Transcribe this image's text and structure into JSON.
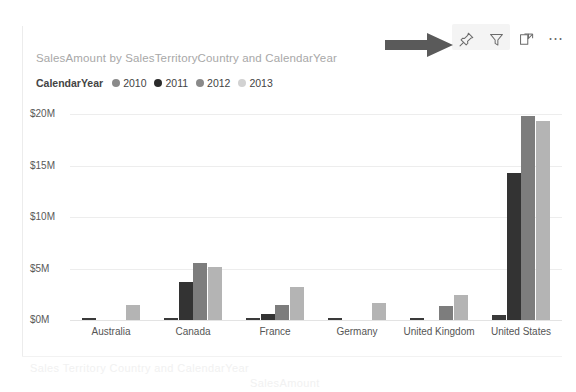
{
  "tile": {
    "title": "SalesAmount by SalesTerritoryCountry and CalendarYear"
  },
  "toolbar": {
    "pin_label": "Pin visual",
    "filter_label": "Filters",
    "focus_label": "Focus mode",
    "more_label": "⋯"
  },
  "annotation": {
    "arrow_name": "right-pointing-arrow",
    "color": "#5a5a5a"
  },
  "legend": {
    "title": "CalendarYear",
    "items": [
      {
        "label": "2010",
        "color": "#8a8a8a"
      },
      {
        "label": "2011",
        "color": "#2b2b2b"
      },
      {
        "label": "2012",
        "color": "#8a8a8a"
      },
      {
        "label": "2013",
        "color": "#d2d2d2"
      }
    ]
  },
  "chart_data": {
    "type": "bar",
    "title": "SalesAmount by SalesTerritoryCountry and CalendarYear",
    "xlabel": "",
    "ylabel": "",
    "categories": [
      "Australia",
      "Canada",
      "France",
      "Germany",
      "United Kingdom",
      "United States"
    ],
    "series": [
      {
        "name": "2010",
        "color": "#3a3a3a",
        "values": [
          0.15,
          0.2,
          0.12,
          0.1,
          0.18,
          0.45
        ]
      },
      {
        "name": "2011",
        "color": "#333333",
        "values": [
          0.0,
          3.7,
          0.55,
          0.0,
          0.0,
          14.3
        ]
      },
      {
        "name": "2012",
        "color": "#7d7d7d",
        "values": [
          0.0,
          5.5,
          1.5,
          0.0,
          1.4,
          19.8
        ]
      },
      {
        "name": "2013",
        "color": "#b4b4b4",
        "values": [
          1.5,
          5.1,
          3.2,
          1.7,
          2.4,
          19.3
        ]
      }
    ],
    "yticks": [
      "$0M",
      "$5M",
      "$10M",
      "$15M",
      "$20M"
    ],
    "ytick_values": [
      0,
      5,
      10,
      15,
      20
    ],
    "ylim": [
      0,
      20
    ],
    "grid": true,
    "legend_position": "top-left",
    "value_unit": "millions USD"
  },
  "ghost_text": {
    "line1": "Sales Territory Country and CalendarYear",
    "line2": "SalesAmount"
  }
}
